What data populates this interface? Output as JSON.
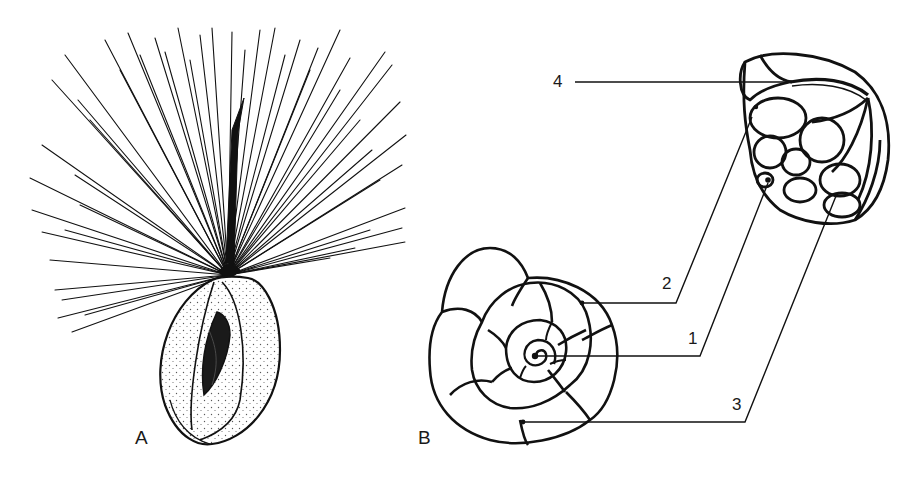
{
  "figure": {
    "panels": [
      {
        "id": "A",
        "label": "A",
        "description": "organism with radiating pseudopodia/spines emerging from an elongated shell with aperture"
      },
      {
        "id": "B",
        "label": "B",
        "description": "shell shown in spiral view and side view with numbered callouts"
      }
    ],
    "callouts": [
      {
        "number": "1"
      },
      {
        "number": "2"
      },
      {
        "number": "3"
      },
      {
        "number": "4"
      }
    ],
    "colors": {
      "ink": "#111111",
      "background": "#ffffff"
    }
  }
}
